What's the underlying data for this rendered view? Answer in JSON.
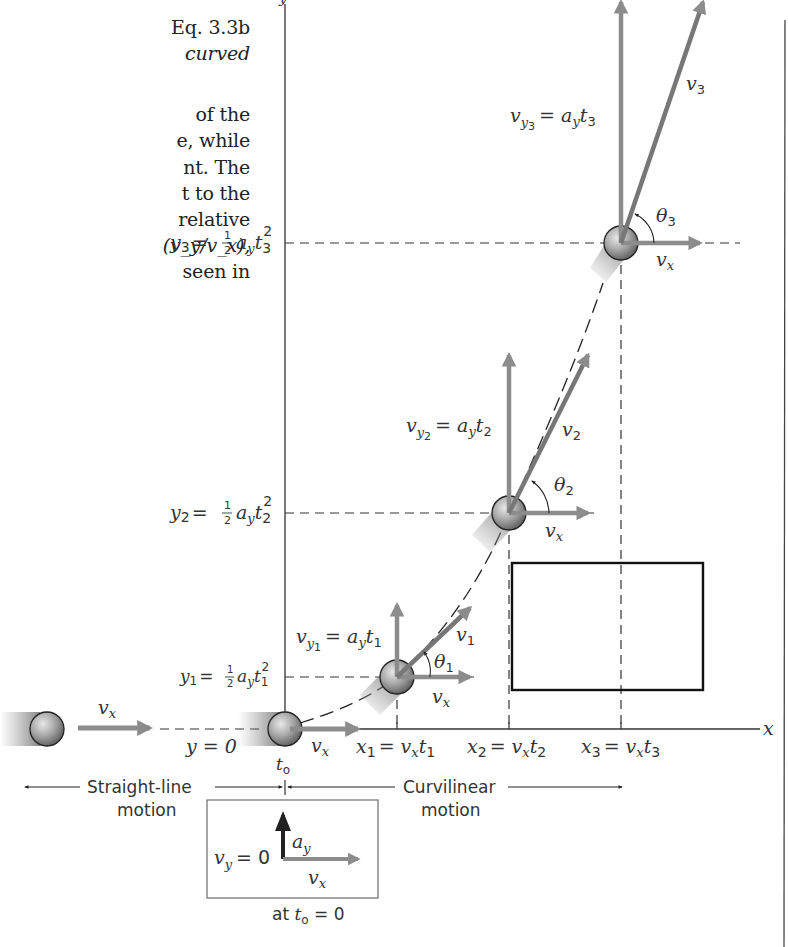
{
  "body_text": {
    "lines": [
      {
        "text": "Eq. 3.3b",
        "italic": false
      },
      {
        "text": "curved",
        "italic": true
      },
      {
        "text": "of  the",
        "italic": false
      },
      {
        "text": "e, while",
        "italic": false
      },
      {
        "text": "nt. The",
        "italic": false
      },
      {
        "text": "t to the",
        "italic": false
      },
      {
        "text": "relative",
        "italic": false
      },
      {
        "text": "(v_y/v_x),",
        "italic": false
      },
      {
        "text": "seen in",
        "italic": false
      }
    ]
  },
  "figure": {
    "axes": {
      "x_label": "x",
      "y_label": "y"
    },
    "colors": {
      "vector_gray": "#8c8c8c",
      "axis": "#333333",
      "ball": "#9a9a9a",
      "box": "#111111"
    },
    "y_levels": [
      {
        "name": "y3",
        "label_main": "y",
        "sub": "3",
        "eq": "=",
        "frac": "1/2",
        "rhs": "a",
        "rhs_sub": "y",
        "t": "t",
        "t_sub": "3",
        "pow": "2"
      },
      {
        "name": "y2",
        "label_main": "y",
        "sub": "2",
        "eq": "=",
        "frac": "1/2",
        "rhs": "a",
        "rhs_sub": "y",
        "t": "t",
        "t_sub": "2",
        "pow": "2"
      },
      {
        "name": "y1",
        "label_main": "y",
        "sub": "1",
        "eq": "=",
        "frac": "1/2",
        "rhs": "a",
        "rhs_sub": "y",
        "t": "t",
        "t_sub": "1",
        "pow": "2"
      }
    ],
    "y0_label": "y = 0",
    "x_levels": [
      {
        "label": "x",
        "sub": "1",
        "rhs": "= v",
        "rhs_sub": "x",
        "t": "t",
        "t_sub": "1"
      },
      {
        "label": "x",
        "sub": "2",
        "rhs": "= v",
        "rhs_sub": "x",
        "t": "t",
        "t_sub": "2"
      },
      {
        "label": "x",
        "sub": "3",
        "rhs": "= v",
        "rhs_sub": "x",
        "t": "t",
        "t_sub": "3"
      }
    ],
    "velocity_labels": {
      "vx": "v",
      "vx_sub": "x",
      "vy1": "v",
      "vy1_sub": "y",
      "vy1_subsub": "1",
      "vy1_rhs": "= a",
      "vy1_rhs_sub": "y",
      "vy1_t": "t",
      "vy1_t_sub": "1",
      "vy2": "v",
      "vy2_sub": "y",
      "vy2_subsub": "2",
      "vy2_rhs": "= a",
      "vy2_rhs_sub": "y",
      "vy2_t": "t",
      "vy2_t_sub": "2",
      "vy3": "v",
      "vy3_sub": "y",
      "vy3_subsub": "3",
      "vy3_rhs": "= a",
      "vy3_rhs_sub": "y",
      "vy3_t": "t",
      "vy3_t_sub": "3",
      "v1": "v",
      "v1_sub": "1",
      "v2": "v",
      "v2_sub": "2",
      "v3": "v",
      "v3_sub": "3",
      "theta1": "θ",
      "theta1_sub": "1",
      "theta2": "θ",
      "theta2_sub": "2",
      "theta3": "θ",
      "theta3_sub": "3"
    },
    "t0_label": "t",
    "t0_sub": "o",
    "motion_labels": {
      "straight_line_1": "Straight-line",
      "straight_line_2": "motion",
      "curvilinear_1": "Curvilinear",
      "curvilinear_2": "motion"
    },
    "inset": {
      "vy_label": "v",
      "vy_sub": "y",
      "vy_eq": "= 0",
      "ay_label": "a",
      "ay_sub": "y",
      "vx_label": "v",
      "vx_sub": "x",
      "caption_pre": "at ",
      "caption_t": "t",
      "caption_t_sub": "o",
      "caption_post": " = 0"
    }
  }
}
